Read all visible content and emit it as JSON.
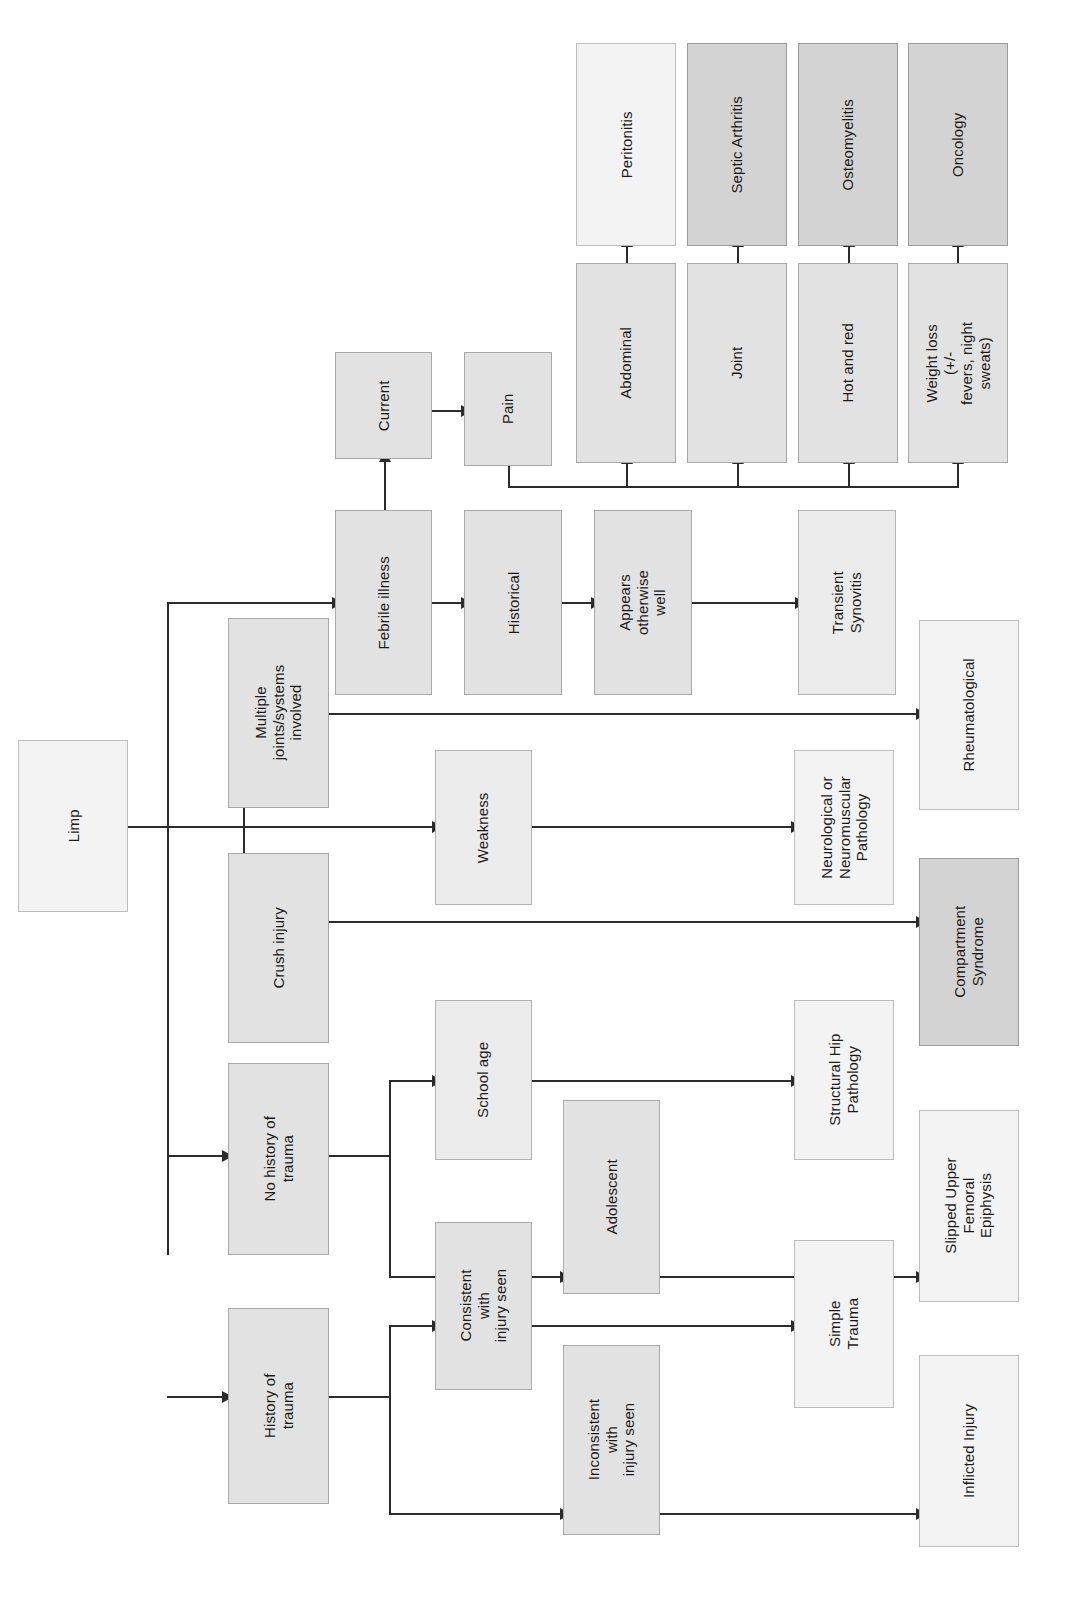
{
  "diagram": {
    "title": "Limp",
    "orientation": "rotated-90-ccw",
    "colors": {
      "lightest": "#f3f3f3",
      "light": "#ebebeb",
      "mid": "#e2e2e2",
      "dark": "#d3d3d3",
      "line": "#2b2b2b",
      "border": "#a8a8a8"
    }
  },
  "nodes": {
    "root": "Limp",
    "multiple_joints": "Multiple\njoints/systems\ninvolved",
    "crush_injury": "Crush injury",
    "no_history_trauma": "No history of trauma",
    "history_trauma": "History of trauma",
    "febrile_illness": "Febrile illness",
    "historical": "Historical",
    "current": "Current",
    "pain": "Pain",
    "appears_well": "Appears otherwise\nwell",
    "weakness": "Weakness",
    "school_age": "School age",
    "adolescent": "Adolescent",
    "consistent_injury": "Consistent with\ninjury seen",
    "inconsistent_injury": "Inconsistent with\ninjury seen",
    "abdominal": "Abdominal",
    "joint": "Joint",
    "hot_and_red": "Hot and red",
    "weight_loss": "Weight loss (+/-\nfevers, night sweats)",
    "peritonitis": "Peritonitis",
    "septic_arthritis": "Septic Arthritis",
    "osteomyelitis": "Osteomyelitis",
    "oncology": "Oncology",
    "transient_synovitis": "Transient Synovitis",
    "rheumatological": "Rheumatological",
    "neuro_pathology": "Neurological or\nNeuromuscular\nPathology",
    "compartment_syndrome": "Compartment\nSyndrome",
    "structural_hip": "Structural Hip\nPathology",
    "slipped_epiphysis": "Slipped Upper\nFemoral Epiphysis",
    "simple_trauma": "Simple Trauma",
    "inflicted_injury": "Inflicted Injury"
  }
}
